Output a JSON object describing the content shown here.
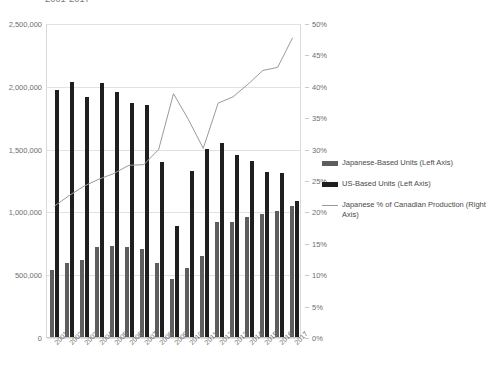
{
  "chart_data": {
    "type": "bar",
    "title": "2001-2017",
    "xlabel": "",
    "ylabel": "",
    "categories": [
      "2001",
      "2002",
      "2003",
      "2004",
      "2005",
      "2006",
      "2007",
      "2008",
      "2009",
      "2010",
      "2011",
      "2012",
      "2013",
      "2014",
      "2015",
      "2016",
      "2017"
    ],
    "left_axis": {
      "label": "Units",
      "min": 0,
      "max": 2500000,
      "step": 500000,
      "ticks": [
        "0",
        "500,000",
        "1,000,000",
        "1,500,000",
        "2,000,000",
        "2,500,000"
      ]
    },
    "right_axis": {
      "label": "Percent",
      "min": 0,
      "max": 50,
      "step": 5,
      "ticks": [
        "0%",
        "5%",
        "10%",
        "15%",
        "20%",
        "25%",
        "30%",
        "35%",
        "40%",
        "45%",
        "50%"
      ]
    },
    "grid": true,
    "legend_position": "right",
    "series": [
      {
        "name": "Japanese-Based Units (Left Axis)",
        "type": "bar",
        "axis": "left",
        "color": "#5e5e5e",
        "values": [
          545000,
          600000,
          625000,
          725000,
          735000,
          725000,
          705000,
          595000,
          470000,
          560000,
          650000,
          920000,
          925000,
          960000,
          985000,
          1010000,
          1055000
        ]
      },
      {
        "name": "US-Based Units (Left Axis)",
        "type": "bar",
        "axis": "left",
        "color": "#1f1f1f",
        "values": [
          1975000,
          2035000,
          1915000,
          2030000,
          1960000,
          1870000,
          1855000,
          1400000,
          890000,
          1330000,
          1505000,
          1550000,
          1455000,
          1410000,
          1320000,
          1315000,
          1090000
        ]
      },
      {
        "name": "Japanese % of Canadian Production (Right Axis)",
        "type": "line",
        "axis": "right",
        "color": "#9a9a9a",
        "values": [
          21.0,
          22.7,
          24.2,
          25.3,
          26.2,
          27.5,
          27.6,
          30.0,
          38.9,
          34.8,
          30.2,
          37.4,
          38.4,
          40.4,
          42.6,
          43.1,
          47.8
        ]
      }
    ]
  }
}
